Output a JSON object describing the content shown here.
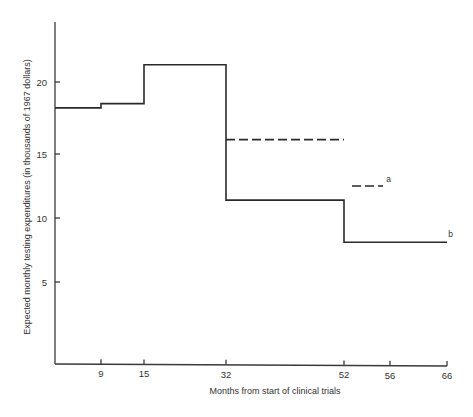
{
  "chart_data": {
    "type": "line",
    "subtype": "step",
    "title": "",
    "xlabel": "Months from start of clinical trials",
    "ylabel": "Expected monthly testing expenditures (in thousands of 1967 dollars)",
    "x_ticks": [
      9,
      15,
      32,
      52,
      56,
      66
    ],
    "y_ticks": [
      5,
      10,
      15,
      20
    ],
    "xlim": [
      0,
      66
    ],
    "ylim": [
      0,
      24
    ],
    "grid": false,
    "legend": null,
    "series": [
      {
        "name": "b",
        "style": "solid",
        "segments": [
          {
            "x_start": 0,
            "x_end": 9,
            "y": 18.2
          },
          {
            "x_start": 9,
            "x_end": 15,
            "y": 18.5
          },
          {
            "x_start": 15,
            "x_end": 32,
            "y": 21.2
          },
          {
            "x_start": 32,
            "x_end": 52,
            "y": 11.4
          },
          {
            "x_start": 52,
            "x_end": 66,
            "y": 8.1
          }
        ]
      },
      {
        "name": "dashed (32-52)",
        "style": "dashed",
        "segments": [
          {
            "x_start": 32,
            "x_end": 52,
            "y": 16.0
          }
        ]
      },
      {
        "name": "a",
        "style": "dashed",
        "segments": [
          {
            "x_start": 53,
            "x_end": 56,
            "y": 12.5
          }
        ]
      }
    ],
    "annotations": [
      {
        "text": "a",
        "x": 56.5,
        "y": 12.8
      },
      {
        "text": "b",
        "x": 66.2,
        "y": 8.5
      }
    ]
  },
  "layout": {
    "x_pixels": {
      "0": 55,
      "9": 101,
      "15": 144,
      "32": 226,
      "52": 344,
      "53": 352,
      "56": 383,
      "56tick": 390,
      "66": 447
    },
    "tick_px": [
      101,
      144,
      226,
      344,
      390,
      447
    ],
    "y_px": {
      "5": 282,
      "10": 218,
      "15": 154,
      "20": 82
    },
    "axis": {
      "left": 55,
      "top": 22,
      "bottom": 364,
      "right": 447
    }
  }
}
